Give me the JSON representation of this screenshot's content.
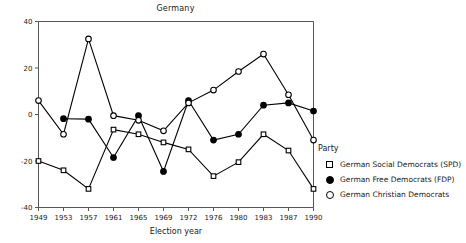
{
  "chart_data": {
    "type": "line",
    "title": "Germany",
    "xlabel": "Election year",
    "ylabel": "",
    "categories": [
      "1949",
      "1953",
      "1957",
      "1961",
      "1965",
      "1969",
      "1972",
      "1976",
      "1980",
      "1983",
      "1987",
      "1990"
    ],
    "ylim": [
      -40,
      40
    ],
    "yticks": [
      -40,
      -20,
      0,
      20,
      40
    ],
    "ytick_labels": [
      "-40",
      "-20",
      "0",
      "20",
      "40"
    ],
    "grid": false,
    "legend_position": "right",
    "legend_title": "Party",
    "series": [
      {
        "name": "German Social Democrats (SPD)",
        "marker": "open-square",
        "values": [
          -20,
          -24,
          -32,
          -6.5,
          -8.5,
          -12,
          -15,
          -26.5,
          -20.5,
          -8.5,
          -15.5,
          -32
        ]
      },
      {
        "name": "German Free Democrats (FDP)",
        "marker": "filled-circle",
        "values": [
          null,
          -1.8,
          -2,
          -18.5,
          -0.5,
          -24.5,
          6,
          -11,
          -8.5,
          4,
          5,
          1.5
        ]
      },
      {
        "name": "German Christian Democrats",
        "marker": "open-circle",
        "values": [
          6,
          -8.5,
          32.5,
          -0.5,
          -2.5,
          -7,
          5,
          10.5,
          18.5,
          26,
          8.5,
          -11
        ]
      }
    ]
  },
  "chart": {
    "title": "Germany",
    "xlabel": "Election year",
    "ytick_labels": [
      "40",
      "20",
      "0",
      "-20",
      "-40"
    ],
    "xtick_labels": [
      "1949",
      "1953",
      "1957",
      "1961",
      "1965",
      "1969",
      "1972",
      "1976",
      "1980",
      "1983",
      "1987",
      "1990"
    ]
  },
  "legend": {
    "title": "Party",
    "items": [
      {
        "label": "German Social Democrats (SPD)",
        "marker": "open-square"
      },
      {
        "label": "German Free Democrats (FDP)",
        "marker": "filled-circle"
      },
      {
        "label": "German Christian Democrats",
        "marker": "open-circle"
      }
    ]
  },
  "colors": {
    "ink": "#000000",
    "axis": "#555555",
    "background": "#ffffff"
  }
}
